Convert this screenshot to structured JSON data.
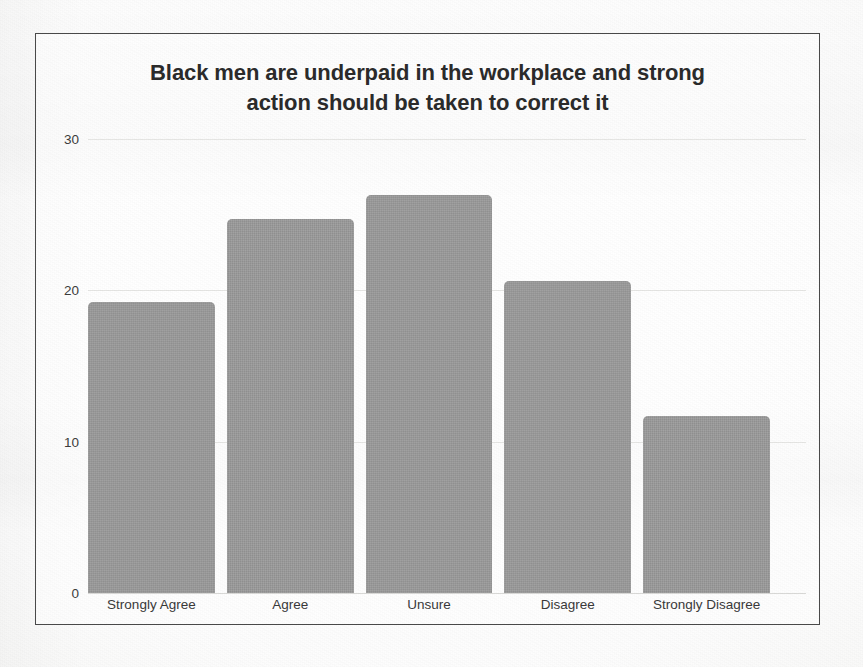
{
  "chart_data": {
    "type": "bar",
    "title": "Black men are underpaid in the workplace and strong action should be taken to correct it",
    "title_line1": "Black men are underpaid in the workplace and strong",
    "title_line2": "action should be taken to correct it",
    "xlabel": "",
    "ylabel": "",
    "categories": [
      "Strongly Agree",
      "Agree",
      "Unsure",
      "Disagree",
      "Strongly Disagree"
    ],
    "values": [
      19.2,
      24.7,
      26.3,
      20.6,
      11.7
    ],
    "ylim": [
      0,
      30
    ],
    "yticks": [
      0,
      10,
      20,
      30
    ],
    "ytick_labels": [
      "0",
      "10",
      "20",
      "30"
    ],
    "grid": true,
    "legend": false,
    "bar_color": "#9b9b9b",
    "title_color": "#2b2b2b",
    "frame_color": "#4a4a4a"
  }
}
